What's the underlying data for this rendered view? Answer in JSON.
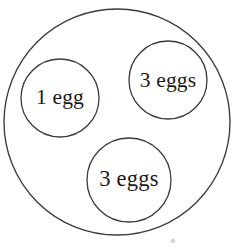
{
  "diagram": {
    "type": "set-containment-diagram",
    "background_color": "#ffffff",
    "stroke_color": "#3a3a3c",
    "text_color": "#1a1a1a",
    "outer_group": {
      "name": "outer-boundary-circle",
      "label": "",
      "cx": 117,
      "cy": 122,
      "r": 113
    },
    "inner_groups": [
      {
        "name": "group-one-egg",
        "label": "1 egg",
        "count": 1,
        "cx": 60,
        "cy": 98,
        "r": 39,
        "text_x": 60,
        "text_y": 99
      },
      {
        "name": "group-three-eggs-top-right",
        "label": "3 eggs",
        "count": 3,
        "cx": 168,
        "cy": 80,
        "r": 39,
        "text_x": 168,
        "text_y": 82
      },
      {
        "name": "group-three-eggs-bottom",
        "label": "3 eggs",
        "count": 3,
        "cx": 129,
        "cy": 180,
        "r": 42,
        "text_x": 129,
        "text_y": 181
      }
    ],
    "artifact_speck": {
      "name": "scan-speck",
      "cx": 173,
      "cy": 241,
      "r": 2.4
    },
    "total_eggs": 7
  }
}
